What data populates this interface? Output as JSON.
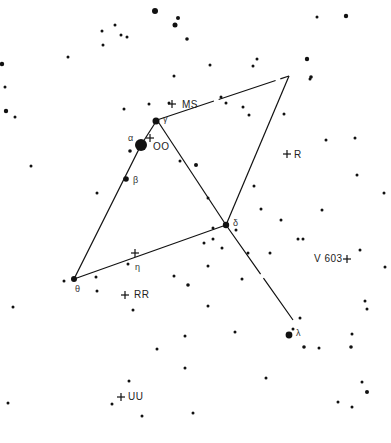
{
  "chart_title": "Star chart (constellation finder)",
  "colors": {
    "background": "#ffffff",
    "ink": "#111111"
  },
  "constellation_lines": [
    {
      "from": "gamma",
      "to": "alpha_east",
      "x1": 157,
      "y1": 120,
      "x2": 289,
      "y2": 76,
      "dashed": true
    },
    {
      "from": "gamma",
      "to": "delta",
      "x1": 157,
      "y1": 120,
      "x2": 226,
      "y2": 225
    },
    {
      "from": "east_star",
      "to": "delta",
      "x1": 289,
      "y1": 76,
      "x2": 226,
      "y2": 225
    },
    {
      "from": "gamma",
      "to": "alpha",
      "x1": 157,
      "y1": 120,
      "x2": 141,
      "y2": 145,
      "dashed": true
    },
    {
      "from": "alpha",
      "to": "theta",
      "x1": 141,
      "y1": 145,
      "x2": 74,
      "y2": 279
    },
    {
      "from": "theta",
      "to": "delta",
      "x1": 74,
      "y1": 279,
      "x2": 226,
      "y2": 225
    },
    {
      "from": "delta",
      "to": "lambda",
      "x1": 226,
      "y1": 225,
      "x2": 293,
      "y2": 320,
      "dashed": true
    }
  ],
  "named_stars": [
    {
      "id": "alpha",
      "greek": "α",
      "x": 141,
      "y": 145,
      "r": 6,
      "lx": 128,
      "ly": 133
    },
    {
      "id": "beta",
      "greek": "β",
      "x": 126,
      "y": 179,
      "r": 2.8,
      "lx": 133,
      "ly": 175
    },
    {
      "id": "gamma",
      "greek": "γ",
      "x": 156,
      "y": 121,
      "r": 3.5,
      "lx": 163,
      "ly": 114
    },
    {
      "id": "delta",
      "greek": "δ",
      "x": 226,
      "y": 225,
      "r": 3.2,
      "lx": 233,
      "ly": 218
    },
    {
      "id": "eta",
      "greek": "η",
      "x": 128,
      "y": 264,
      "r": 1.5,
      "lx": 135,
      "ly": 262
    },
    {
      "id": "theta",
      "greek": "θ",
      "x": 74,
      "y": 279,
      "r": 3,
      "lx": 75,
      "ly": 284
    },
    {
      "id": "lambda",
      "greek": "λ",
      "x": 289,
      "y": 335,
      "r": 3.4,
      "lx": 296,
      "ly": 328
    }
  ],
  "variable_stars": [
    {
      "id": "MS",
      "label": "MS",
      "cx": 172,
      "cy": 104,
      "lx": 182,
      "ly": 100
    },
    {
      "id": "OO",
      "label": "OO",
      "cx": 150,
      "cy": 138,
      "lx": 153,
      "ly": 142
    },
    {
      "id": "R",
      "label": "R",
      "cx": 287,
      "cy": 154,
      "lx": 294,
      "ly": 150
    },
    {
      "id": "V603",
      "label": "V 603",
      "cx": 347,
      "cy": 259,
      "lx": 314,
      "ly": 254,
      "label_left": true
    },
    {
      "id": "eta_cross",
      "label": "",
      "cx": 135,
      "cy": 253
    },
    {
      "id": "RR",
      "label": "RR",
      "cx": 125,
      "cy": 295,
      "lx": 134,
      "ly": 290
    },
    {
      "id": "UU",
      "label": "UU",
      "cx": 121,
      "cy": 397,
      "lx": 128,
      "ly": 392
    }
  ],
  "field_stars": [
    [
      155,
      11,
      3
    ],
    [
      178,
      18,
      2
    ],
    [
      175,
      25,
      2.5
    ],
    [
      187,
      39,
      1.8
    ],
    [
      102,
      31,
      1.5
    ],
    [
      115,
      25,
      1.5
    ],
    [
      121,
      35,
      1.5
    ],
    [
      127,
      37,
      1.5
    ],
    [
      103,
      45,
      1.5
    ],
    [
      68,
      57,
      1.5
    ],
    [
      2,
      64,
      2.2
    ],
    [
      5,
      87,
      1.5
    ],
    [
      6,
      111,
      2.2
    ],
    [
      15,
      117,
      1.5
    ],
    [
      124,
      109,
      1.5
    ],
    [
      149,
      104,
      1.5
    ],
    [
      169,
      103,
      1.5
    ],
    [
      174,
      76,
      1.5
    ],
    [
      253,
      66,
      1.5
    ],
    [
      257,
      59,
      1.5
    ],
    [
      221,
      97,
      1.5
    ],
    [
      226,
      103,
      1.5
    ],
    [
      243,
      107,
      1.5
    ],
    [
      249,
      115,
      1.5
    ],
    [
      284,
      114,
      1.5
    ],
    [
      210,
      65,
      1.5
    ],
    [
      307,
      59,
      2.2
    ],
    [
      311,
      77,
      1.8
    ],
    [
      310,
      79,
      1.5
    ],
    [
      317,
      17,
      1.5
    ],
    [
      346,
      16,
      2.2
    ],
    [
      130,
      151,
      1.8
    ],
    [
      31,
      166,
      1.5
    ],
    [
      97,
      193,
      1.5
    ],
    [
      196,
      165,
      2
    ],
    [
      180,
      161,
      1.5
    ],
    [
      208,
      198,
      1.5
    ],
    [
      254,
      186,
      1.5
    ],
    [
      326,
      140,
      1.5
    ],
    [
      355,
      138,
      1.5
    ],
    [
      357,
      175,
      1.5
    ],
    [
      261,
      209,
      1.5
    ],
    [
      322,
      210,
      1.5
    ],
    [
      384,
      193,
      1.5
    ],
    [
      236,
      230,
      1.5
    ],
    [
      213,
      228,
      1.5
    ],
    [
      213,
      239,
      1.5
    ],
    [
      248,
      253,
      1.5
    ],
    [
      303,
      239,
      1.5
    ],
    [
      281,
      220,
      1.5
    ],
    [
      204,
      243,
      1.5
    ],
    [
      222,
      248,
      1.5
    ],
    [
      270,
      253,
      1.5
    ],
    [
      298,
      239,
      1.5
    ],
    [
      360,
      250,
      1.5
    ],
    [
      385,
      267,
      1.5
    ],
    [
      365,
      301,
      1.5
    ],
    [
      367,
      309,
      1.5
    ],
    [
      242,
      279,
      1.5
    ],
    [
      64,
      281,
      1.5
    ],
    [
      96,
      277,
      1.5
    ],
    [
      174,
      276,
      1.5
    ],
    [
      188,
      285,
      1.8
    ],
    [
      208,
      266,
      1.5
    ],
    [
      13,
      307,
      1.5
    ],
    [
      133,
      310,
      1.5
    ],
    [
      208,
      306,
      1.5
    ],
    [
      235,
      332,
      1.5
    ],
    [
      293,
      329,
      1.5
    ],
    [
      300,
      318,
      1.5
    ],
    [
      304,
      347,
      1.8
    ],
    [
      319,
      348,
      1.5
    ],
    [
      352,
      334,
      1.5
    ],
    [
      351,
      347,
      1.8
    ],
    [
      266,
      378,
      1.5
    ],
    [
      362,
      382,
      1.5
    ],
    [
      367,
      392,
      2
    ],
    [
      338,
      402,
      1.5
    ],
    [
      352,
      407,
      1.5
    ],
    [
      185,
      336,
      1.5
    ],
    [
      157,
      349,
      1.5
    ],
    [
      129,
      381,
      1.5
    ],
    [
      112,
      404,
      1.5
    ],
    [
      142,
      416,
      1.5
    ],
    [
      185,
      368,
      1.5
    ],
    [
      193,
      413,
      1.5
    ],
    [
      8,
      403,
      1.5
    ],
    [
      97,
      291,
      1.5
    ]
  ]
}
